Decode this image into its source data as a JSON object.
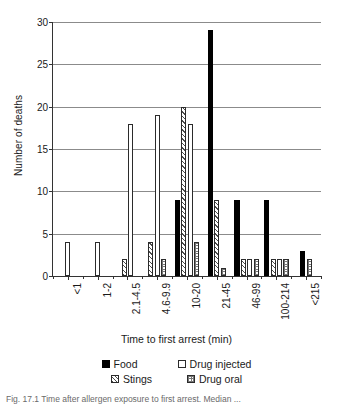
{
  "chart_data": {
    "type": "bar",
    "title": "",
    "xlabel": "Time to first arrest (min)",
    "ylabel": "Number of deaths",
    "ylim": [
      0,
      30
    ],
    "yticks": [
      0,
      5,
      10,
      15,
      20,
      25,
      30
    ],
    "grid": true,
    "legend_position": "bottom",
    "categories": [
      "<1",
      "1-2",
      "2.1-4.5",
      "4.6-9.9",
      "10-20",
      "21-45",
      "46-99",
      "100-214",
      "<215"
    ],
    "series": [
      {
        "name": "Food",
        "pattern": "solid-black",
        "values": [
          0,
          0,
          0,
          0,
          9,
          29,
          9,
          9,
          3
        ]
      },
      {
        "name": "Drug injected",
        "pattern": "white-open",
        "values": [
          4,
          4,
          18,
          19,
          18,
          0,
          2,
          2,
          0
        ]
      },
      {
        "name": "Stings",
        "pattern": "diagonal-hatch",
        "values": [
          0,
          0,
          2,
          4,
          20,
          9,
          2,
          2,
          0
        ]
      },
      {
        "name": "Drug oral",
        "pattern": "dotted-grid",
        "values": [
          0,
          0,
          0,
          2,
          4,
          1,
          2,
          2,
          2
        ]
      }
    ]
  },
  "axes": {
    "y_title": "Number of deaths",
    "x_title": "Time to first arrest (min)",
    "y_tick_labels": [
      "0",
      "5",
      "10",
      "15",
      "20",
      "25",
      "30"
    ],
    "x_tick_labels": [
      "<1",
      "1-2",
      "2.1-4.5",
      "4.6-9.9",
      "10-20",
      "21-45",
      "46-99",
      "100-214",
      "<215"
    ]
  },
  "legend": {
    "row1": [
      {
        "label": "Food",
        "swatch": "food"
      },
      {
        "label": "Drug injected",
        "swatch": "injected"
      }
    ],
    "row2": [
      {
        "label": "Stings",
        "swatch": "stings"
      },
      {
        "label": "Drug oral",
        "swatch": "oral"
      }
    ]
  },
  "caption": {
    "text": "Fig. 17.1  Time after allergen exposure to first arrest. Median ..."
  },
  "colors": {
    "axis": "#333333",
    "gridline": "#8b8b8b",
    "food": "#000000",
    "text": "#1a1a1a"
  }
}
